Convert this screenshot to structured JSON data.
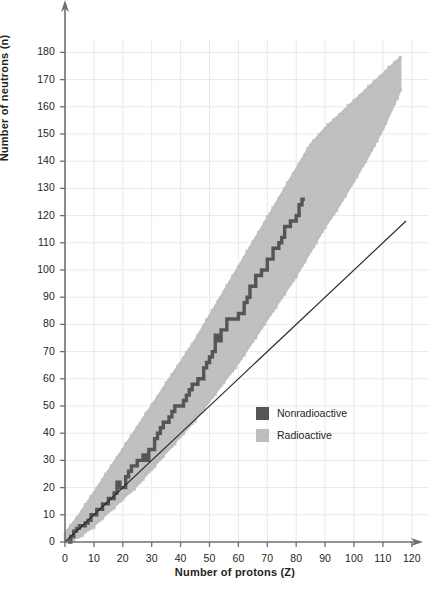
{
  "chart_data": {
    "type": "scatter",
    "title": "",
    "xlabel": "Number of protons (Z)",
    "ylabel": "Number of neutrons (n)",
    "xlim": [
      0,
      120
    ],
    "ylim": [
      0,
      185
    ],
    "xticks": [
      "0",
      "10",
      "20",
      "30",
      "40",
      "50",
      "60",
      "70",
      "80",
      "90",
      "100",
      "110",
      "120"
    ],
    "yticks": [
      "0",
      "10",
      "20",
      "30",
      "40",
      "50",
      "60",
      "70",
      "80",
      "90",
      "100",
      "110",
      "120",
      "130",
      "140",
      "150",
      "160",
      "170",
      "180"
    ],
    "grid": true,
    "legend_position": "center-right",
    "legend": [
      {
        "label": "Nonradioactive",
        "color": "#555555"
      },
      {
        "label": "Radioactive",
        "color": "#bdbdbd"
      }
    ],
    "annotations": [
      {
        "name": "n-equals-z-line",
        "description": "straight reference line N = Z",
        "from": [
          0,
          0
        ],
        "to": [
          118,
          118
        ]
      }
    ],
    "series": [
      {
        "name": "Radioactive",
        "color": "#bdbdbd",
        "description": "Broad band of unstable (radioactive) nuclides surrounding the stable band",
        "lower_edge": [
          [
            0,
            0
          ],
          [
            5,
            2
          ],
          [
            10,
            6
          ],
          [
            15,
            11
          ],
          [
            20,
            16
          ],
          [
            25,
            21
          ],
          [
            30,
            27
          ],
          [
            35,
            33
          ],
          [
            40,
            39
          ],
          [
            45,
            45
          ],
          [
            50,
            52
          ],
          [
            55,
            59
          ],
          [
            60,
            66
          ],
          [
            65,
            74
          ],
          [
            70,
            82
          ],
          [
            75,
            90
          ],
          [
            80,
            98
          ],
          [
            85,
            107
          ],
          [
            90,
            116
          ],
          [
            95,
            124
          ],
          [
            100,
            133
          ],
          [
            105,
            142
          ],
          [
            110,
            152
          ],
          [
            116,
            166
          ]
        ],
        "upper_edge": [
          [
            0,
            3
          ],
          [
            5,
            10
          ],
          [
            10,
            18
          ],
          [
            15,
            26
          ],
          [
            20,
            34
          ],
          [
            25,
            42
          ],
          [
            30,
            50
          ],
          [
            35,
            58
          ],
          [
            40,
            66
          ],
          [
            45,
            74
          ],
          [
            50,
            83
          ],
          [
            55,
            92
          ],
          [
            60,
            101
          ],
          [
            65,
            110
          ],
          [
            70,
            119
          ],
          [
            75,
            128
          ],
          [
            80,
            137
          ],
          [
            85,
            146
          ],
          [
            90,
            152
          ],
          [
            95,
            157
          ],
          [
            100,
            162
          ],
          [
            105,
            167
          ],
          [
            110,
            172
          ],
          [
            116,
            178
          ]
        ]
      },
      {
        "name": "Nonradioactive",
        "color": "#555555",
        "description": "Stair-step band of stable nuclides, N = Z at low Z curving to N/Z about 1.5 at Z = 83",
        "points": [
          [
            1,
            0
          ],
          [
            2,
            2
          ],
          [
            3,
            4
          ],
          [
            4,
            5
          ],
          [
            5,
            6
          ],
          [
            6,
            6
          ],
          [
            7,
            7
          ],
          [
            8,
            8
          ],
          [
            9,
            10
          ],
          [
            10,
            10
          ],
          [
            11,
            12
          ],
          [
            12,
            12
          ],
          [
            13,
            14
          ],
          [
            14,
            14
          ],
          [
            15,
            16
          ],
          [
            16,
            16
          ],
          [
            17,
            18
          ],
          [
            18,
            22
          ],
          [
            19,
            20
          ],
          [
            20,
            20
          ],
          [
            21,
            24
          ],
          [
            22,
            26
          ],
          [
            23,
            28
          ],
          [
            24,
            28
          ],
          [
            25,
            30
          ],
          [
            26,
            30
          ],
          [
            27,
            32
          ],
          [
            28,
            30
          ],
          [
            29,
            34
          ],
          [
            30,
            34
          ],
          [
            31,
            38
          ],
          [
            32,
            40
          ],
          [
            33,
            42
          ],
          [
            34,
            44
          ],
          [
            35,
            44
          ],
          [
            36,
            46
          ],
          [
            37,
            48
          ],
          [
            38,
            50
          ],
          [
            39,
            50
          ],
          [
            40,
            50
          ],
          [
            41,
            52
          ],
          [
            42,
            54
          ],
          [
            43,
            56
          ],
          [
            44,
            58
          ],
          [
            45,
            58
          ],
          [
            46,
            60
          ],
          [
            47,
            60
          ],
          [
            48,
            64
          ],
          [
            49,
            66
          ],
          [
            50,
            68
          ],
          [
            51,
            70
          ],
          [
            52,
            76
          ],
          [
            53,
            74
          ],
          [
            54,
            78
          ],
          [
            55,
            78
          ],
          [
            56,
            82
          ],
          [
            57,
            82
          ],
          [
            58,
            82
          ],
          [
            59,
            82
          ],
          [
            60,
            84
          ],
          [
            61,
            84
          ],
          [
            62,
            88
          ],
          [
            63,
            90
          ],
          [
            64,
            94
          ],
          [
            65,
            94
          ],
          [
            66,
            98
          ],
          [
            67,
            98
          ],
          [
            68,
            100
          ],
          [
            69,
            100
          ],
          [
            70,
            104
          ],
          [
            71,
            104
          ],
          [
            72,
            108
          ],
          [
            73,
            108
          ],
          [
            74,
            110
          ],
          [
            75,
            112
          ],
          [
            76,
            116
          ],
          [
            77,
            116
          ],
          [
            78,
            118
          ],
          [
            79,
            118
          ],
          [
            80,
            120
          ],
          [
            81,
            124
          ],
          [
            82,
            126
          ],
          [
            83,
            126
          ]
        ]
      }
    ]
  },
  "axes": {
    "x_title": "Number of protons (Z)",
    "y_title": "Number of neutrons (n)"
  },
  "legend": {
    "items": [
      {
        "label": "Nonradioactive",
        "color": "#555555"
      },
      {
        "label": "Radioactive",
        "color": "#bdbdbd"
      }
    ]
  }
}
